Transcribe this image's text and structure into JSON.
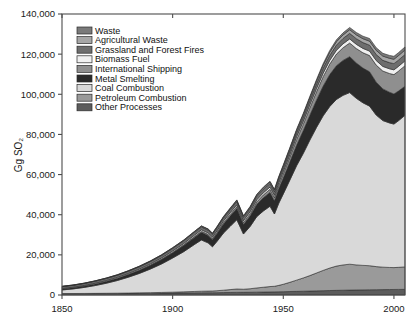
{
  "chart_data": {
    "type": "area",
    "title": "",
    "xlabel": "",
    "ylabel": "Gg SO₂",
    "xlim": [
      1850,
      2005
    ],
    "ylim": [
      0,
      140000
    ],
    "grid": false,
    "legend_position": "top-left",
    "x_ticks": [
      1850,
      1900,
      1950,
      2000
    ],
    "x_tick_labels": [
      "1850",
      "1900",
      "1950",
      "2000"
    ],
    "y_ticks": [
      0,
      20000,
      40000,
      60000,
      80000,
      100000,
      120000,
      140000
    ],
    "y_tick_labels": [
      "0",
      "20,000",
      "40,000",
      "60,000",
      "80,000",
      "100,000",
      "120,000",
      "140,000"
    ],
    "stacked": true,
    "stack_order_bottom_to_top": [
      "Other Processes",
      "Petroleum Combustion",
      "Coal Combustion",
      "Metal Smelting",
      "International Shipping",
      "Biomass Fuel",
      "Grassland and Forest Fires",
      "Agricultural Waste",
      "Waste"
    ],
    "x": [
      1850,
      1855,
      1860,
      1865,
      1870,
      1875,
      1880,
      1885,
      1890,
      1895,
      1900,
      1905,
      1910,
      1913,
      1916,
      1918,
      1920,
      1923,
      1926,
      1929,
      1932,
      1935,
      1938,
      1941,
      1944,
      1946,
      1948,
      1950,
      1953,
      1956,
      1959,
      1962,
      1965,
      1968,
      1971,
      1974,
      1977,
      1980,
      1983,
      1986,
      1989,
      1992,
      1995,
      1998,
      2000,
      2002,
      2005
    ],
    "series": [
      {
        "name": "Waste",
        "color": "#7a7a7a",
        "values": [
          40,
          45,
          50,
          55,
          62,
          70,
          80,
          90,
          100,
          115,
          130,
          150,
          170,
          185,
          195,
          200,
          215,
          240,
          265,
          290,
          300,
          320,
          350,
          370,
          390,
          410,
          440,
          470,
          520,
          580,
          640,
          700,
          770,
          840,
          910,
          980,
          1050,
          1120,
          1180,
          1240,
          1300,
          1340,
          1380,
          1420,
          1450,
          1470,
          1500
        ]
      },
      {
        "name": "Agricultural Waste",
        "color": "#a6a6a6",
        "values": [
          120,
          130,
          145,
          160,
          175,
          190,
          210,
          230,
          250,
          275,
          300,
          330,
          360,
          385,
          400,
          410,
          430,
          470,
          510,
          550,
          580,
          610,
          660,
          700,
          740,
          780,
          830,
          880,
          960,
          1050,
          1140,
          1230,
          1330,
          1430,
          1530,
          1630,
          1720,
          1810,
          1880,
          1950,
          2020,
          2070,
          2120,
          2170,
          2200,
          2230,
          2260
        ]
      },
      {
        "name": "Grassland and Forest Fires",
        "color": "#6e6e6e",
        "values": [
          900,
          920,
          950,
          980,
          1010,
          1040,
          1080,
          1120,
          1160,
          1200,
          1250,
          1300,
          1350,
          1390,
          1410,
          1420,
          1450,
          1500,
          1550,
          1600,
          1630,
          1670,
          1720,
          1760,
          1800,
          1840,
          1890,
          1940,
          2020,
          2100,
          2180,
          2260,
          2350,
          2440,
          2520,
          2600,
          2680,
          2760,
          2820,
          2880,
          2940,
          2980,
          3020,
          3060,
          3090,
          3110,
          3140
        ]
      },
      {
        "name": "Biomass Fuel",
        "color": "#f0f0f0",
        "values": [
          300,
          320,
          345,
          370,
          395,
          420,
          450,
          480,
          515,
          550,
          590,
          630,
          675,
          705,
          725,
          735,
          760,
          800,
          845,
          890,
          920,
          960,
          1010,
          1055,
          1100,
          1140,
          1190,
          1240,
          1320,
          1400,
          1480,
          1560,
          1650,
          1740,
          1820,
          1900,
          1980,
          2050,
          2110,
          2170,
          2230,
          2270,
          2310,
          2350,
          2380,
          2400,
          2430
        ]
      },
      {
        "name": "International Shipping",
        "color": "#8f8f8f",
        "values": [
          20,
          25,
          35,
          50,
          70,
          95,
          125,
          160,
          200,
          250,
          310,
          380,
          460,
          520,
          560,
          580,
          640,
          740,
          850,
          960,
          1020,
          1120,
          1280,
          1420,
          1560,
          1680,
          1850,
          2050,
          2400,
          2800,
          3200,
          3650,
          4150,
          4700,
          5250,
          5800,
          6300,
          6800,
          7200,
          7650,
          8100,
          8500,
          8900,
          9350,
          9650,
          9900,
          10250
        ]
      },
      {
        "name": "Metal Smelting",
        "color": "#2a2a2a",
        "values": [
          450,
          520,
          620,
          750,
          900,
          1080,
          1300,
          1550,
          1850,
          2200,
          2600,
          3050,
          3550,
          3850,
          3700,
          3500,
          3900,
          4500,
          5100,
          5600,
          4700,
          5300,
          6100,
          6600,
          6900,
          6500,
          7200,
          7900,
          9000,
          10200,
          11300,
          12400,
          13600,
          14800,
          15900,
          16800,
          17400,
          17900,
          17600,
          17300,
          17100,
          16400,
          15800,
          15300,
          15000,
          14800,
          14500
        ]
      },
      {
        "name": "Coal Combustion",
        "color": "#d9d9d9",
        "values": [
          1800,
          2300,
          3000,
          3900,
          5000,
          6300,
          7900,
          9700,
          11800,
          14200,
          17000,
          20000,
          23500,
          25500,
          24000,
          22000,
          24500,
          28500,
          31500,
          34500,
          27500,
          31000,
          35500,
          38000,
          40000,
          36000,
          41000,
          45000,
          51000,
          57000,
          62000,
          67500,
          72500,
          77000,
          80500,
          83000,
          84500,
          85500,
          83000,
          81000,
          79500,
          75500,
          73000,
          72000,
          71500,
          73000,
          75500
        ]
      },
      {
        "name": "Petroleum Combustion",
        "color": "#9a9a9a",
        "values": [
          10,
          15,
          25,
          40,
          60,
          90,
          130,
          180,
          250,
          330,
          430,
          550,
          700,
          800,
          850,
          880,
          980,
          1200,
          1450,
          1700,
          1550,
          1750,
          2100,
          2400,
          2700,
          2800,
          3200,
          3700,
          4600,
          5600,
          6600,
          7700,
          8900,
          10100,
          11200,
          12100,
          12600,
          12900,
          12500,
          12200,
          12000,
          11500,
          11200,
          11000,
          10900,
          11000,
          11200
        ]
      },
      {
        "name": "Other Processes",
        "color": "#5c5c5c",
        "values": [
          700,
          720,
          745,
          770,
          795,
          820,
          850,
          880,
          915,
          950,
          990,
          1030,
          1075,
          1105,
          1120,
          1130,
          1155,
          1200,
          1250,
          1300,
          1330,
          1370,
          1420,
          1465,
          1510,
          1550,
          1600,
          1650,
          1730,
          1810,
          1890,
          1970,
          2060,
          2150,
          2230,
          2310,
          2380,
          2450,
          2500,
          2550,
          2600,
          2640,
          2680,
          2720,
          2750,
          2780,
          2810
        ]
      }
    ]
  },
  "legend": {
    "items": [
      {
        "label": "Waste",
        "color": "#7a7a7a"
      },
      {
        "label": "Agricultural Waste",
        "color": "#a6a6a6"
      },
      {
        "label": "Grassland and Forest Fires",
        "color": "#6e6e6e"
      },
      {
        "label": "Biomass Fuel",
        "color": "#f0f0f0"
      },
      {
        "label": "International Shipping",
        "color": "#8f8f8f"
      },
      {
        "label": "Metal Smelting",
        "color": "#2a2a2a"
      },
      {
        "label": "Coal Combustion",
        "color": "#d9d9d9"
      },
      {
        "label": "Petroleum Combustion",
        "color": "#9a9a9a"
      },
      {
        "label": "Other Processes",
        "color": "#5c5c5c"
      }
    ]
  },
  "axes": {
    "y_title": "Gg SO₂"
  }
}
